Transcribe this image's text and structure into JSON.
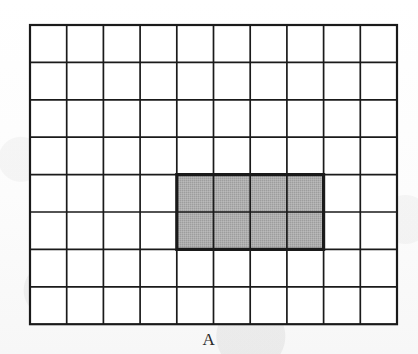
{
  "figure": {
    "label": "A",
    "type": "grid-area-diagram"
  },
  "grid": {
    "columns": 10,
    "rows": 8,
    "total_cells": 80,
    "origin_x": 30,
    "origin_y": 25,
    "cell_width": 36.7,
    "cell_height": 37.4,
    "line_color": "#1a1a1a",
    "line_width": 1.7,
    "border_width": 2.2,
    "background_color": "#ffffff"
  },
  "shaded_region": {
    "start_column": 4,
    "start_row": 4,
    "span_columns": 4,
    "span_rows": 2,
    "cell_count": 8,
    "fill_color": "#aeaeae",
    "outline_color": "#1a1a1a",
    "outline_width": 3.2,
    "x": 140,
    "y": 135,
    "width": 146,
    "height": 74
  },
  "caption": {
    "text": "A",
    "x": 209,
    "y": 330
  },
  "chart_data": {
    "type": "heatmap",
    "title": "A",
    "xlabel": "",
    "ylabel": "",
    "columns": 10,
    "rows": 8,
    "shaded_cells": [
      [
        3,
        3
      ],
      [
        4,
        3
      ],
      [
        5,
        3
      ],
      [
        6,
        3
      ],
      [
        3,
        4
      ],
      [
        4,
        4
      ],
      [
        5,
        4
      ],
      [
        6,
        4
      ]
    ],
    "shaded_count": 8,
    "unshaded_count": 72,
    "legend": []
  }
}
